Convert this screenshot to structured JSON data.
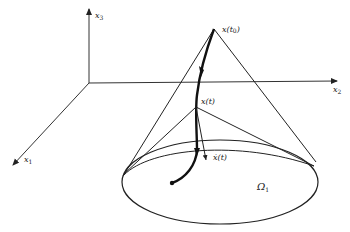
{
  "diagram": {
    "type": "3d-cone-trajectory",
    "colors": {
      "stroke": "#222222",
      "background": "#ffffff"
    },
    "axes": [
      {
        "id": "x1",
        "label": "x",
        "subscript": "1"
      },
      {
        "id": "x2",
        "label": "x",
        "subscript": "2"
      },
      {
        "id": "x3",
        "label": "x",
        "subscript": "3"
      }
    ],
    "labels": {
      "apex": "x(t",
      "apex_sub": "0",
      "apex_close": ")",
      "current_point": "x(t)",
      "velocity": "ẋ(t)",
      "region": "Ω",
      "region_sub": "1"
    }
  }
}
